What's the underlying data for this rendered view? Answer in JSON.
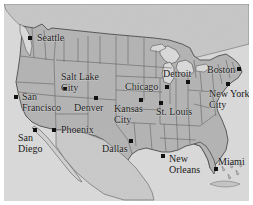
{
  "figure": {
    "name": "united-states-city-map",
    "width": 253,
    "height": 205,
    "frame_color": "#ffffff",
    "ocean_color": "#d9d9d9",
    "land_color": "#b8b8b8",
    "border_color": "#4a4a4a",
    "marker_color": "#111111",
    "label_color": "#1a1a1a"
  },
  "cities": [
    {
      "name": "Seattle",
      "label": "Seattle",
      "lines": [
        "Seattle"
      ],
      "dot_x": 26,
      "dot_y": 34,
      "label_x": 33,
      "label_y": 29,
      "anchor": "left"
    },
    {
      "name": "Salt Lake City",
      "label": "Salt Lake City",
      "lines": [
        "Salt Lake",
        "City"
      ],
      "dot_x": 61,
      "dot_y": 85,
      "label_x": 57,
      "label_y": 68,
      "anchor": "left"
    },
    {
      "name": "San Francisco",
      "label": "San Francisco",
      "lines": [
        "San",
        "Francisco"
      ],
      "dot_x": 12,
      "dot_y": 93,
      "label_x": 18,
      "label_y": 88,
      "anchor": "left"
    },
    {
      "name": "Denver",
      "label": "Denver",
      "lines": [
        "Denver"
      ],
      "dot_x": 92,
      "dot_y": 94,
      "label_x": 70,
      "label_y": 99,
      "anchor": "left"
    },
    {
      "name": "Kansas City",
      "label": "Kansas City",
      "lines": [
        "Kansas",
        "City"
      ],
      "dot_x": 137,
      "dot_y": 96,
      "label_x": 110,
      "label_y": 100,
      "anchor": "left"
    },
    {
      "name": "Chicago",
      "label": "Chicago",
      "lines": [
        "Chicago"
      ],
      "dot_x": 163,
      "dot_y": 83,
      "label_x": 121,
      "label_y": 78,
      "anchor": "left"
    },
    {
      "name": "St. Louis",
      "label": "St. Louis",
      "lines": [
        "St. Louis"
      ],
      "dot_x": 157,
      "dot_y": 99,
      "label_x": 152,
      "label_y": 103,
      "anchor": "left"
    },
    {
      "name": "Detroit",
      "label": "Detroit",
      "lines": [
        "Detroit"
      ],
      "dot_x": 184,
      "dot_y": 78,
      "label_x": 159,
      "label_y": 65,
      "anchor": "left"
    },
    {
      "name": "Boston",
      "label": "Boston",
      "lines": [
        "Boston"
      ],
      "dot_x": 235,
      "dot_y": 65,
      "label_x": 203,
      "label_y": 61,
      "anchor": "left"
    },
    {
      "name": "New York City",
      "label": "New York City",
      "lines": [
        "New York",
        "City"
      ],
      "dot_x": 224,
      "dot_y": 80,
      "label_x": 205,
      "label_y": 85,
      "anchor": "left"
    },
    {
      "name": "San Diego",
      "label": "San Diego",
      "lines": [
        "San",
        "Diego"
      ],
      "dot_x": 31,
      "dot_y": 126,
      "label_x": 14,
      "label_y": 129,
      "anchor": "left"
    },
    {
      "name": "Phoenix",
      "label": "Phoenix",
      "lines": [
        "Phoenix"
      ],
      "dot_x": 50,
      "dot_y": 126,
      "label_x": 57,
      "label_y": 121,
      "anchor": "left"
    },
    {
      "name": "Dallas",
      "label": "Dallas",
      "lines": [
        "Dallas"
      ],
      "dot_x": 127,
      "dot_y": 137,
      "label_x": 98,
      "label_y": 140,
      "anchor": "left"
    },
    {
      "name": "New Orleans",
      "label": "New Orleans",
      "lines": [
        "New",
        "Orleans"
      ],
      "dot_x": 159,
      "dot_y": 152,
      "label_x": 165,
      "label_y": 150,
      "anchor": "left"
    },
    {
      "name": "Miami",
      "label": "Miami",
      "lines": [
        "Miami"
      ],
      "dot_x": 212,
      "dot_y": 165,
      "label_x": 214,
      "label_y": 153,
      "anchor": "left"
    }
  ]
}
